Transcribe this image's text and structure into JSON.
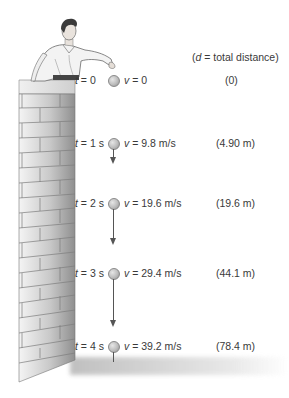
{
  "header": {
    "legend_open": "(",
    "legend_var": "d",
    "legend_rest": " = total distance)"
  },
  "rows": [
    {
      "t_var": "t",
      "t_value": " = 0",
      "v_var": "v",
      "v_value": " = 0",
      "distance": "(0)",
      "arrow_length": 0
    },
    {
      "t_var": "t",
      "t_value": " = 1 s",
      "v_var": "v",
      "v_value": " = 9.8 m/s",
      "distance": "(4.90 m)",
      "arrow_length": 14
    },
    {
      "t_var": "t",
      "t_value": " = 2 s",
      "v_var": "v",
      "v_value": " = 19.6 m/s",
      "distance": "(19.6 m)",
      "arrow_length": 35
    },
    {
      "t_var": "t",
      "t_value": " = 3 s",
      "v_var": "v",
      "v_value": " = 29.4 m/s",
      "distance": "(44.1 m)",
      "arrow_length": 48
    },
    {
      "t_var": "t",
      "t_value": " = 4 s",
      "v_var": "v",
      "v_value": " = 39.2 m/s",
      "distance": "(78.4 m)",
      "arrow_length": 10
    }
  ],
  "colors": {
    "wall_light": "#f2f2f2",
    "wall_dark": "#9a9a9a",
    "mortar": "#7a7a7a",
    "ball": "#bdbdbd",
    "arrow": "#555555",
    "shadow": "#c8c8c8"
  }
}
